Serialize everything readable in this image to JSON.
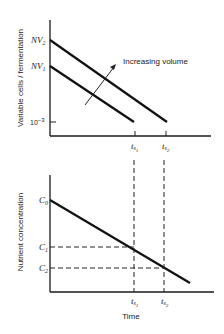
{
  "top_chart": {
    "ylabel": "Variable cells / fermentation",
    "y_ticks": [
      {
        "label": "NV",
        "sub": "2",
        "y": 40
      },
      {
        "label": "NV",
        "sub": "1",
        "y": 66
      },
      {
        "label": "10",
        "sup": "-3",
        "y": 122
      }
    ],
    "x_ticks": [
      {
        "label": "t",
        "sub": "s",
        "subsub": "1",
        "x": 135
      },
      {
        "label": "t",
        "sub": "s",
        "subsub": "2",
        "x": 166
      }
    ],
    "annotation": "Increasing volume",
    "lines": [
      {
        "name": "NV2 line",
        "from": [
          50,
          40
        ],
        "to": [
          167,
          122
        ]
      },
      {
        "name": "NV1 line",
        "from": [
          50,
          66
        ],
        "to": [
          134,
          122
        ]
      }
    ]
  },
  "bottom_chart": {
    "ylabel": "Nutrient concentration",
    "xlabel": "Time",
    "y_ticks": [
      {
        "label": "C",
        "sub": "0",
        "y": 200
      },
      {
        "label": "C",
        "sub": "1",
        "y": 247
      },
      {
        "label": "C",
        "sub": "2",
        "y": 268
      }
    ],
    "x_ticks": [
      {
        "label": "t",
        "sub": "s",
        "subsub": "1",
        "x": 134
      },
      {
        "label": "t",
        "sub": "s",
        "subsub": "2",
        "x": 164
      }
    ],
    "lines": [
      {
        "name": "nutrient line",
        "from": [
          50,
          200
        ],
        "to": [
          190,
          283
        ]
      }
    ]
  },
  "labels": {
    "top_ylabel": "Variable cells / fermentation",
    "bottom_ylabel": "Nutrient concentration",
    "xlabel": "Time",
    "annotation": "Increasing volume",
    "nv2": "NV",
    "nv2_sub": "2",
    "nv1": "NV",
    "nv1_sub": "1",
    "ten": "10",
    "ten_sup": "−3",
    "c0": "C",
    "c0_sub": "0",
    "c1": "C",
    "c1_sub": "1",
    "c2": "C",
    "c2_sub": "2",
    "t": "t",
    "s": "s",
    "one": "1",
    "two": "2"
  }
}
